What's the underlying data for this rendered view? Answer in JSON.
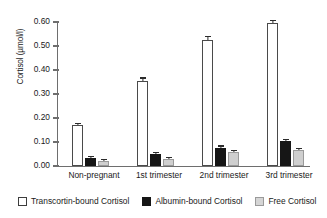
{
  "chart_data": {
    "type": "bar",
    "title": "",
    "xlabel": "",
    "ylabel": "Cortisol (µmol/l)",
    "ylim": [
      0.0,
      0.6
    ],
    "yticks": [
      "0.00",
      "0.10",
      "0.20",
      "0.30",
      "0.40",
      "0.50",
      "0.60"
    ],
    "ytick_values": [
      0.0,
      0.1,
      0.2,
      0.3,
      0.4,
      0.5,
      0.6
    ],
    "grid": false,
    "legend_position": "bottom",
    "categories": [
      "Non-pregnant",
      "1st trimester",
      "2nd trimester",
      "3rd trimester"
    ],
    "series": [
      {
        "name": "Transcortin-bound Cortisol",
        "color": "#ffffff",
        "values": [
          0.17,
          0.355,
          0.525,
          0.595
        ],
        "errors": [
          0.006,
          0.009,
          0.012,
          0.008
        ]
      },
      {
        "name": "Albumin-bound Cortisol",
        "color": "#161616",
        "values": [
          0.032,
          0.048,
          0.075,
          0.103
        ],
        "errors": [
          0.004,
          0.005,
          0.006,
          0.006
        ]
      },
      {
        "name": "Free Cortisol",
        "color": "#d5d5d5",
        "values": [
          0.02,
          0.03,
          0.057,
          0.068
        ],
        "errors": [
          0.003,
          0.004,
          0.004,
          0.004
        ]
      }
    ]
  },
  "axis": {
    "ylabel": "Cortisol (µmol/l)"
  },
  "ticks": {
    "t0": "0.00",
    "t1": "0.10",
    "t2": "0.20",
    "t3": "0.30",
    "t4": "0.40",
    "t5": "0.50",
    "t6": "0.60"
  },
  "categories": {
    "c0": "Non-pregnant",
    "c1": "1st trimester",
    "c2": "2nd trimester",
    "c3": "3rd trimester"
  },
  "legend": {
    "items": [
      {
        "label": "Transcortin-bound Cortisol",
        "swatch": "white"
      },
      {
        "label": "Albumin-bound Cortisol",
        "swatch": "black"
      },
      {
        "label": "Free Cortisol",
        "swatch": "grey"
      }
    ]
  }
}
